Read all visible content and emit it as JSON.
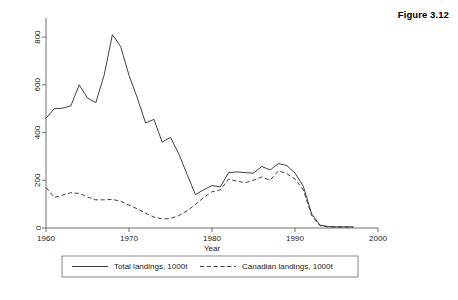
{
  "figure": {
    "title": "Figure 3.12"
  },
  "chart_data": {
    "type": "line",
    "title": "",
    "xlabel": "Year",
    "ylabel": "",
    "xlim": [
      1960,
      2000
    ],
    "ylim": [
      0,
      880
    ],
    "grid": false,
    "legend_position": "bottom",
    "xticks": [
      1960,
      1970,
      1980,
      1990,
      2000
    ],
    "xtick_labels": [
      "1960",
      "1970",
      "1980",
      "1990",
      "2000"
    ],
    "yticks": [
      0,
      200,
      400,
      600,
      800
    ],
    "ytick_labels": [
      "0",
      "200",
      "400",
      "600",
      "800"
    ],
    "x": [
      1960,
      1961,
      1962,
      1963,
      1964,
      1965,
      1966,
      1967,
      1968,
      1969,
      1970,
      1971,
      1972,
      1973,
      1974,
      1975,
      1976,
      1977,
      1978,
      1979,
      1980,
      1981,
      1982,
      1983,
      1984,
      1985,
      1986,
      1987,
      1988,
      1989,
      1990,
      1991,
      1992,
      1993,
      1994,
      1995,
      1996,
      1997
    ],
    "series": [
      {
        "name": "Total landings, 1000t",
        "style": "solid",
        "values": [
          460,
          500,
          502,
          512,
          600,
          545,
          525,
          640,
          810,
          760,
          640,
          545,
          440,
          455,
          360,
          380,
          310,
          225,
          140,
          160,
          178,
          172,
          232,
          235,
          232,
          230,
          258,
          243,
          270,
          262,
          230,
          175,
          60,
          12,
          6,
          5,
          5,
          5
        ]
      },
      {
        "name": "Canadian landings, 1000t",
        "style": "dashed",
        "values": [
          170,
          128,
          138,
          148,
          145,
          130,
          118,
          118,
          120,
          112,
          96,
          80,
          62,
          46,
          38,
          40,
          52,
          72,
          98,
          128,
          152,
          160,
          205,
          196,
          190,
          200,
          214,
          200,
          240,
          228,
          205,
          160,
          52,
          10,
          5,
          4,
          4,
          4
        ]
      }
    ]
  },
  "legend": {
    "items": [
      {
        "label": "Total landings, 1000t",
        "style": "solid"
      },
      {
        "label": "Canadian landings, 1000t",
        "style": "dashed"
      }
    ]
  },
  "colors": {
    "line": "#2b2b2b",
    "axis": "#4d4d4d",
    "background": "#ffffff"
  }
}
